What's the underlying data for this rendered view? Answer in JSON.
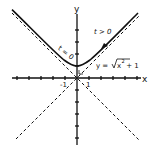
{
  "diagram": {
    "title": "",
    "axes": {
      "x_label": "x",
      "y_label": "y",
      "tick_labels": {
        "neg_one": "-1",
        "pos_one": "1"
      }
    },
    "curve": {
      "equation_label": "y = √x² + 1",
      "equation_prefix": "y = ",
      "radicand": "x",
      "exponent": "2",
      "suffix": " + 1"
    },
    "parameter_labels": {
      "t_zero": "t = 0",
      "t_positive": "t > 0"
    },
    "asymptotes": [
      "y = x",
      "y = -x"
    ],
    "colors": {
      "ink": "#111111",
      "background": "#ffffff"
    }
  }
}
